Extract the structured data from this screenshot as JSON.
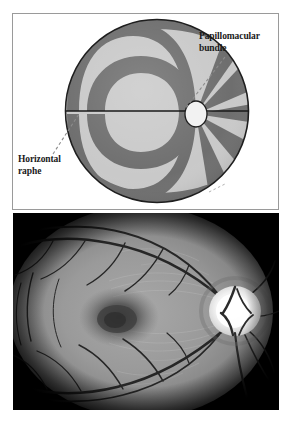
{
  "figure": {
    "name": "retinal-nerve-fiber-layer-figure",
    "panels": [
      {
        "id": "diagram",
        "type": "schematic",
        "description": "Schematic of retinal nerve fiber layer showing arcuate bundles, optic disc, horizontal raphe and papillomacular bundle"
      },
      {
        "id": "photo",
        "type": "fundus-photograph",
        "description": "Red-free grayscale fundus photograph of the posterior pole with optic disc and macula"
      }
    ]
  },
  "diagram": {
    "labels": {
      "papillomacular": "Papillomacular\nbundle",
      "horizontal_raphe": "Horizontal\nraphe"
    },
    "colors": {
      "band_dark": "#6e6e6e",
      "band_light": "#c9c9c9",
      "outline": "#1e1e1e",
      "disc_fill": "#f2f2f2",
      "background": "#ffffff",
      "frame": "#9a9a9a",
      "leader_line": "#8c8c8c"
    },
    "geometry": {
      "circle_center_x": 144,
      "circle_center_y": 97,
      "circle_radius": 92,
      "disc_center_x": 183,
      "disc_center_y": 100,
      "disc_radius_x": 11,
      "disc_radius_y": 13
    }
  },
  "photo": {
    "colors": {
      "vignette": "#000000",
      "retina_mid": "#8e8e8e",
      "retina_light": "#b4b4b4",
      "macula_dark": "#3a3a3a",
      "disc_white": "#f6f6f6",
      "vessel": "#2a2a2a"
    },
    "features": {
      "optic_disc": "optic-disc",
      "macula": "macula",
      "vessels": "retinal-vessels"
    }
  }
}
